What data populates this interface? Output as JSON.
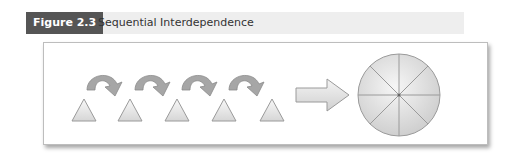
{
  "figure": {
    "label": "Figure 2.3",
    "title": "Sequential Interdependence"
  },
  "diagram": {
    "triangles_count": 5,
    "curved_arrows_count": 4,
    "result_shape": "circle divided into 8 segments",
    "colors": {
      "label_bg": "#555555",
      "caption_bg": "#eeeeee",
      "shape_fill": "#e6e6e6",
      "shape_stroke": "#999999",
      "curved_arrow_fill": "#a6a6a6"
    }
  }
}
